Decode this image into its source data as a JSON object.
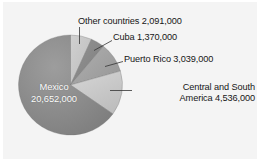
{
  "chart_data": {
    "type": "pie",
    "title": "",
    "subtitle": "",
    "xlabel": "",
    "ylabel": "",
    "legend_position": "callout-labels",
    "grid": false,
    "total": 31688000,
    "categories": [
      "Other countries",
      "Cuba",
      "Puerto Rico",
      "Central and South America",
      "Mexico"
    ],
    "values": [
      2091000,
      1370000,
      3039000,
      4536000,
      20652000
    ],
    "value_labels": [
      "2,091,000",
      "1,370,000",
      "3,039,000",
      "4,536,000",
      "20,652,000"
    ],
    "slices": [
      {
        "name": "Other countries",
        "value": 2091000,
        "value_label": "2,091,000",
        "color": "#c6c6c6",
        "start_angle": 0,
        "end_angle": 23.8
      },
      {
        "name": "Cuba",
        "value": 1370000,
        "value_label": "1,370,000",
        "color": "#8a8a8a",
        "start_angle": 23.8,
        "end_angle": 39.3
      },
      {
        "name": "Puerto Rico",
        "value": 3039000,
        "value_label": "3,039,000",
        "color": "#a5a5a5",
        "start_angle": 39.3,
        "end_angle": 73.9
      },
      {
        "name": "Central and South America",
        "value": 4536000,
        "value_label": "4,536,000",
        "color": "#cccccc",
        "start_angle": 73.9,
        "end_angle": 125.4
      },
      {
        "name": "Mexico",
        "value": 20652000,
        "value_label": "20,652,000",
        "color": "#8d8d8d",
        "start_angle": 125.4,
        "end_angle": 360
      }
    ]
  },
  "labels": {
    "other_countries": "Other countries  2,091,000",
    "cuba": "Cuba  1,370,000",
    "puerto_rico": "Puerto Rico  3,039,000",
    "central_south_line1": "Central and South",
    "central_south_line2": "America  4,536,000",
    "mexico_line1": "Mexico",
    "mexico_line2": "20,652,000"
  },
  "colors": {
    "background": "#f4f4f4",
    "page_background": "#ffffff",
    "text": "#161616",
    "inner_label_text": "#ffffff",
    "leader_line": "#3a3a3a",
    "slice_mexico": "#8d8d8d",
    "slice_central_south": "#cccccc",
    "slice_puerto_rico": "#a5a5a5",
    "slice_cuba": "#8a8a8a",
    "slice_other": "#c6c6c6"
  }
}
